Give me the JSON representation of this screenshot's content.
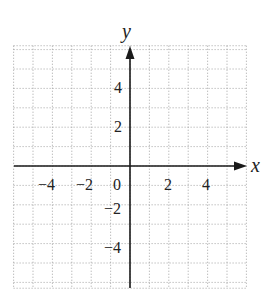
{
  "chart_data": {
    "type": "scatter",
    "title": "",
    "xlabel": "x",
    "ylabel": "y",
    "xlim": [
      -6,
      6
    ],
    "ylim": [
      -6.3,
      6.2
    ],
    "grid": true,
    "grid_style": "dotted",
    "grid_step": 1,
    "x_ticks": [
      -4,
      -2,
      0,
      2,
      4
    ],
    "y_ticks": [
      4,
      2,
      -2,
      -4
    ],
    "x_tick_labels": [
      "−4",
      "−2",
      "0",
      "2",
      "4"
    ],
    "y_tick_labels": [
      "4",
      "2",
      "−2",
      "−4"
    ],
    "series": [],
    "legend": null
  },
  "labels": {
    "x_axis": "x",
    "y_axis": "y",
    "xt_m4": "−4",
    "xt_m2": "−2",
    "origin": "0",
    "xt_2": "2",
    "xt_4": "4",
    "yt_4": "4",
    "yt_2": "2",
    "yt_m2": "−2",
    "yt_m4": "−4"
  },
  "colors": {
    "axis": "#1a1a1a",
    "grid": "#9a9a9a",
    "text": "#222222"
  }
}
